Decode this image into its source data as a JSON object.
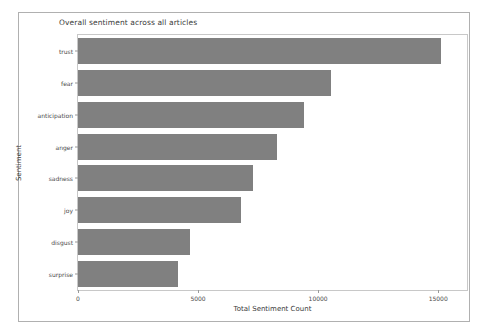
{
  "figure": {
    "background_color": "#ffffff",
    "border_color": "#b0b0b0",
    "bar_color": "#808080"
  },
  "chart_data": {
    "type": "bar",
    "orientation": "horizontal",
    "title": "Overall sentiment across all articles",
    "xlabel": "Total Sentiment Count",
    "ylabel": "Sentiment",
    "categories": [
      "trust",
      "fear",
      "anticipation",
      "anger",
      "sadness",
      "joy",
      "disgust",
      "surprise"
    ],
    "values": [
      15100,
      10550,
      9400,
      8300,
      7300,
      6800,
      4650,
      4150
    ],
    "xticks": [
      0,
      5000,
      10000,
      15000
    ],
    "xtick_labels": [
      "0",
      "5000",
      "10000",
      "15000"
    ],
    "xlim": [
      0,
      16200
    ],
    "grid": false,
    "legend": null,
    "series": [
      {
        "name": "Total Sentiment Count",
        "values": [
          15100,
          10550,
          9400,
          8300,
          7300,
          6800,
          4650,
          4150
        ]
      }
    ]
  }
}
